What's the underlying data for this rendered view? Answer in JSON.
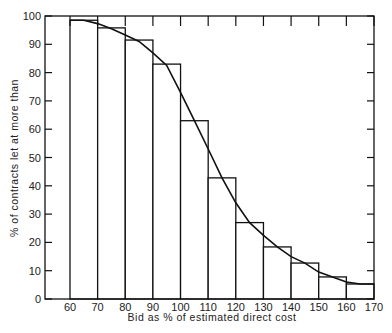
{
  "chart_data": {
    "type": "bar",
    "title": "",
    "xlabel": "Bid as % of estimated direct cost",
    "ylabel": "% of contracts let at more than",
    "xlim": [
      52,
      170
    ],
    "ylim": [
      0,
      100
    ],
    "x_ticks": [
      60,
      70,
      80,
      90,
      100,
      110,
      120,
      130,
      140,
      150,
      160,
      170
    ],
    "y_ticks": [
      0,
      10,
      20,
      30,
      40,
      50,
      60,
      70,
      80,
      90,
      100
    ],
    "grid": false,
    "legend": null,
    "bins": [
      [
        60,
        70
      ],
      [
        70,
        80
      ],
      [
        80,
        90
      ],
      [
        90,
        100
      ],
      [
        100,
        110
      ],
      [
        110,
        120
      ],
      [
        120,
        130
      ],
      [
        130,
        140
      ],
      [
        140,
        150
      ],
      [
        150,
        160
      ],
      [
        160,
        170
      ]
    ],
    "values": [
      98.5,
      95.8,
      91.5,
      83,
      63,
      42.8,
      27,
      18.4,
      12.7,
      7.8,
      5.3
    ],
    "curve": {
      "x": [
        60,
        65,
        70,
        75,
        80,
        85,
        90,
        95,
        100,
        105,
        110,
        115,
        120,
        125,
        130,
        135,
        140,
        145,
        150,
        155,
        160,
        165,
        170
      ],
      "y": [
        98.5,
        98.5,
        97.3,
        95.5,
        93.3,
        91,
        87,
        82.5,
        73,
        63,
        53,
        42.8,
        34,
        27,
        22.5,
        18.4,
        15,
        12.7,
        9.5,
        7.8,
        6,
        5.3,
        5.3
      ]
    }
  }
}
